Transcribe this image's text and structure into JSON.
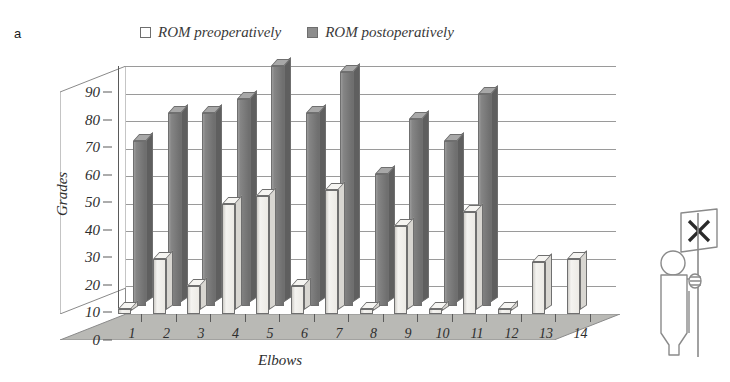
{
  "panel_letter": "a",
  "legend": {
    "entries": [
      {
        "label": "ROM preoperatively",
        "key": "pre",
        "color": "#ffffff"
      },
      {
        "label": "ROM postoperatively",
        "key": "post",
        "color": "#8d8d8d"
      }
    ]
  },
  "axes": {
    "y_title": "Grades",
    "x_title": "Elbows",
    "y_ticks": [
      "0",
      "10",
      "20",
      "30",
      "40",
      "50",
      "60",
      "70",
      "80",
      "90"
    ],
    "x_ticks": [
      "1",
      "2",
      "3",
      "4",
      "5",
      "6",
      "7",
      "8",
      "9",
      "10",
      "11",
      "12",
      "13",
      "14"
    ]
  },
  "mascot": {
    "name": "person-with-x-flag",
    "sign_glyph": "X"
  },
  "chart_data": {
    "type": "bar",
    "title": "",
    "subtitle": "",
    "xlabel": "Elbows",
    "ylabel": "Grades",
    "ylim": [
      0,
      90
    ],
    "ytick_step": 10,
    "grid": true,
    "legend_position": "top-center",
    "three_d": true,
    "categories": [
      "1",
      "2",
      "3",
      "4",
      "5",
      "6",
      "7",
      "8",
      "9",
      "10",
      "11",
      "12",
      "13",
      "14"
    ],
    "series": [
      {
        "name": "ROM preoperatively",
        "color": "#f0efec",
        "values": [
          2,
          20,
          10,
          40,
          43,
          10,
          45,
          2,
          32,
          2,
          37,
          2,
          19,
          20
        ]
      },
      {
        "name": "ROM postoperatively",
        "color": "#7a7a7a",
        "values": [
          60,
          70,
          70,
          75,
          87,
          70,
          85,
          48,
          68,
          60,
          77,
          57,
          70,
          57
        ]
      }
    ]
  }
}
